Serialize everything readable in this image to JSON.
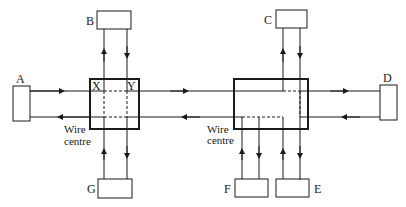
{
  "diagram": {
    "type": "star-wired ring network",
    "stations": {
      "A": "A",
      "B": "B",
      "C": "C",
      "D": "D",
      "E": "E",
      "F": "F",
      "G": "G"
    },
    "wire_centre_left": {
      "label_line1": "Wire",
      "label_line2": "centre",
      "corner_labels": {
        "x": "X",
        "y": "Y"
      }
    },
    "wire_centre_right": {
      "label_line1": "Wire",
      "label_line2": "centre"
    },
    "colors": {
      "line": "#1a1a1a",
      "background": "#ffffff"
    }
  }
}
